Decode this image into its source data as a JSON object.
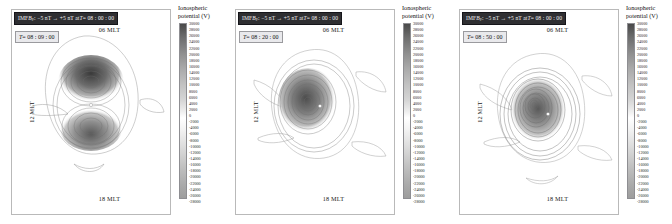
{
  "figure": {
    "width": 672,
    "height": 224,
    "background": "#ffffff"
  },
  "colorbar": {
    "title_line1": "Ionospheric",
    "title_line2": "potential (V)",
    "units": "V",
    "vmax": 30000,
    "vmin": -28000,
    "tick_step": 2000,
    "ticks": [
      "30000",
      "28000",
      "26000",
      "24000",
      "22000",
      "20000",
      "18000",
      "16000",
      "14000",
      "12000",
      "10000",
      "8000",
      "6000",
      "4000",
      "2000",
      "0",
      "-2000",
      "-4000",
      "-6000",
      "-8000",
      "-10000",
      "-12000",
      "-14000",
      "-16000",
      "-18000",
      "-20000",
      "-22000",
      "-24000",
      "-26000",
      "-28000"
    ],
    "colormap": "grayscale",
    "high_color": "#4a4a4a",
    "zero_color": "#ffffff",
    "low_color": "#9d9d9d"
  },
  "axis_labels": {
    "top": "06 MLT",
    "left": "12 MLT",
    "bottom": "18 MLT"
  },
  "panels": [
    {
      "id": "panel-1",
      "title_prefix": "IMF ",
      "title_symbol": "B",
      "title_subscript": "y",
      "title_rest": ": −5 nT → +5 nT at ",
      "title_time_var": "T",
      "title_time_value": " = 08 : 00 : 00",
      "time_label_var": "T",
      "time_label_value": " = 08 : 09 : 00",
      "elapsed_minutes": 9
    },
    {
      "id": "panel-2",
      "title_prefix": "IMF ",
      "title_symbol": "B",
      "title_subscript": "y",
      "title_rest": ": −5 nT → +5 nT at ",
      "title_time_var": "T",
      "title_time_value": " = 08 : 00 : 00",
      "time_label_var": "T",
      "time_label_value": " = 08 : 20 : 00",
      "elapsed_minutes": 20
    },
    {
      "id": "panel-3",
      "title_prefix": "IMF ",
      "title_symbol": "B",
      "title_subscript": "y",
      "title_rest": ": −5 nT → +5 nT at ",
      "title_time_var": "T",
      "title_time_value": " = 08 : 00 : 00",
      "time_label_var": "T",
      "time_label_value": " = 08 : 50 : 00",
      "elapsed_minutes": 50
    }
  ],
  "chart_data": {
    "type": "heatmap",
    "xlabel": "",
    "ylabel": "",
    "legend_position": "right",
    "grid": false,
    "projection": "polar magnetic-local-time",
    "colorbar_label": "Ionospheric potential (V)",
    "zlim": [
      -28000,
      30000
    ],
    "mlt_ticks": [
      "06 MLT",
      "12 MLT",
      "18 MLT"
    ],
    "series": [
      {
        "name": "T = 08 : 09 : 00",
        "description": "Strong bipolar potential cell pair, dark saturated core near 06 MLT side",
        "max_potential": 30000,
        "min_potential": -28000,
        "contour_interval": 2000
      },
      {
        "name": "T = 08 : 20 : 00",
        "description": "Contours reorganizing, cell centre shifted toward dusk",
        "max_potential": 26000,
        "min_potential": -24000,
        "contour_interval": 2000
      },
      {
        "name": "T = 08 : 50 : 00",
        "description": "Relaxed two-cell convection pattern with nested closed contours",
        "max_potential": 22000,
        "min_potential": -20000,
        "contour_interval": 2000
      }
    ]
  }
}
